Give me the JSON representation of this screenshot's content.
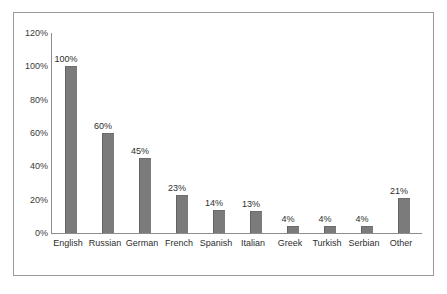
{
  "chart_data": {
    "type": "bar",
    "title": "",
    "subtitle": "",
    "xlabel": "",
    "ylabel": "",
    "categories": [
      "English",
      "Russian",
      "German",
      "French",
      "Spanish",
      "Italian",
      "Greek",
      "Turkish",
      "Serbian",
      "Other"
    ],
    "values": [
      100,
      60,
      45,
      23,
      14,
      13,
      4,
      4,
      4,
      21
    ],
    "data_labels": [
      "100%",
      "60%",
      "45%",
      "23%",
      "14%",
      "13%",
      "4%",
      "4%",
      "4%",
      "21%"
    ],
    "ylim": [
      0,
      120
    ],
    "ytick_values": [
      0,
      20,
      40,
      60,
      80,
      100,
      120
    ],
    "ytick_labels": [
      "0%",
      "20%",
      "40%",
      "60%",
      "80%",
      "100%",
      "120%"
    ],
    "grid": false,
    "legend": null,
    "legend_position": "none",
    "bar_color": "#7b7b7b",
    "axis_color": "#8d8d8d",
    "border_color": "#9a9a9a",
    "background_color": "#ffffff",
    "text_color": "#2e2e2e"
  }
}
